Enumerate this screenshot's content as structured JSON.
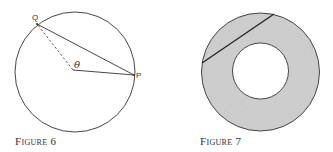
{
  "figures": [
    {
      "caption": "Figure 6",
      "labels": {
        "q": "Q",
        "p": "P",
        "theta": "θ"
      },
      "description": "Circle with chord QP, solid radius to P and dashed radius to Q, angle θ at center"
    },
    {
      "caption": "Figure 7",
      "description": "Shaded annulus with a chord of the outer circle tangent to the inner circle"
    }
  ],
  "colors": {
    "stroke": "#333333",
    "shade": "#c8c8c8"
  }
}
